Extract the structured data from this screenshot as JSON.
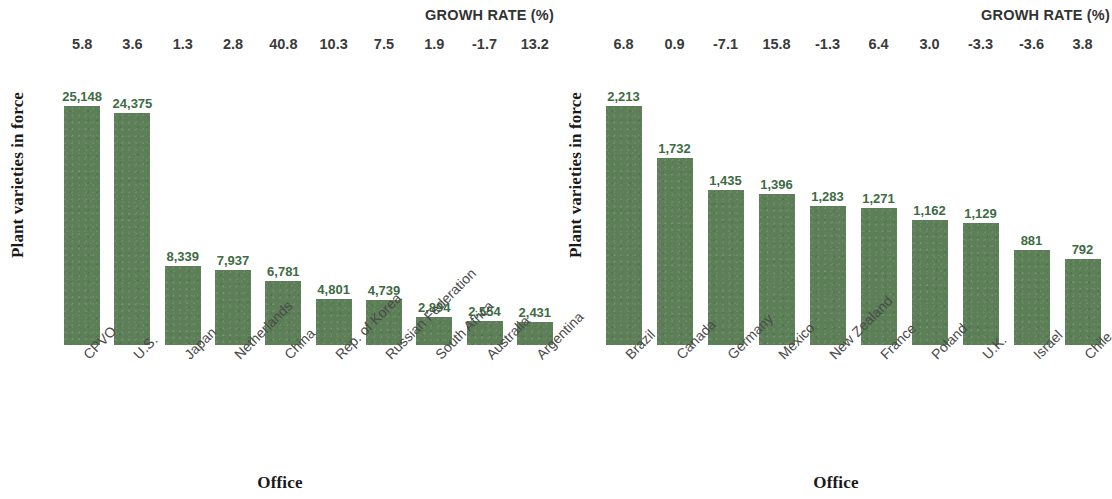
{
  "chart_data": [
    {
      "type": "bar",
      "title": "GROWH RATE (%)",
      "xlabel": "Office",
      "ylabel": "Plant varieties in force",
      "categories": [
        "CPVO",
        "U.S.",
        "Japan",
        "Netherlands",
        "China",
        "Rep. of Korea",
        "Russian Federation",
        "South Africa",
        "Australia",
        "Argentina"
      ],
      "values": [
        25148,
        24375,
        8339,
        7937,
        6781,
        4801,
        4739,
        2894,
        2554,
        2431
      ],
      "value_labels": [
        "25,148",
        "24,375",
        "8,339",
        "7,937",
        "6,781",
        "4,801",
        "4,739",
        "2,894",
        "2,554",
        "2,431"
      ],
      "growth_rates": [
        5.8,
        3.6,
        1.3,
        2.8,
        40.8,
        10.3,
        7.5,
        1.9,
        -1.7,
        13.2
      ],
      "growth_labels": [
        "5.8",
        "3.6",
        "1.3",
        "2.8",
        "40.8",
        "10.3",
        "7.5",
        "1.9",
        "-1.7",
        "13.2"
      ],
      "ylim": [
        0,
        25148
      ],
      "grid": false,
      "legend": "none",
      "bar_color": "#5c7f57",
      "value_label_color": "#3d6b44"
    },
    {
      "type": "bar",
      "title": "GROWH RATE (%)",
      "xlabel": "Office",
      "ylabel": "Plant varieties in force",
      "categories": [
        "Brazil",
        "Canada",
        "Germany",
        "Mexico",
        "New Zealand",
        "France",
        "Poland",
        "U.K.",
        "Israel",
        "Chile"
      ],
      "values": [
        2213,
        1732,
        1435,
        1396,
        1283,
        1271,
        1162,
        1129,
        881,
        792
      ],
      "value_labels": [
        "2,213",
        "1,732",
        "1,435",
        "1,396",
        "1,283",
        "1,271",
        "1,162",
        "1,129",
        "881",
        "792"
      ],
      "growth_rates": [
        6.8,
        0.9,
        -7.1,
        15.8,
        -1.3,
        6.4,
        3.0,
        -3.3,
        -3.6,
        3.8
      ],
      "growth_labels": [
        "6.8",
        "0.9",
        "-7.1",
        "15.8",
        "-1.3",
        "6.4",
        "3.0",
        "-3.3",
        "-3.6",
        "3.8"
      ],
      "ylim": [
        0,
        2213
      ],
      "grid": false,
      "legend": "none",
      "bar_color": "#5c7f57",
      "value_label_color": "#3d6b44"
    }
  ]
}
